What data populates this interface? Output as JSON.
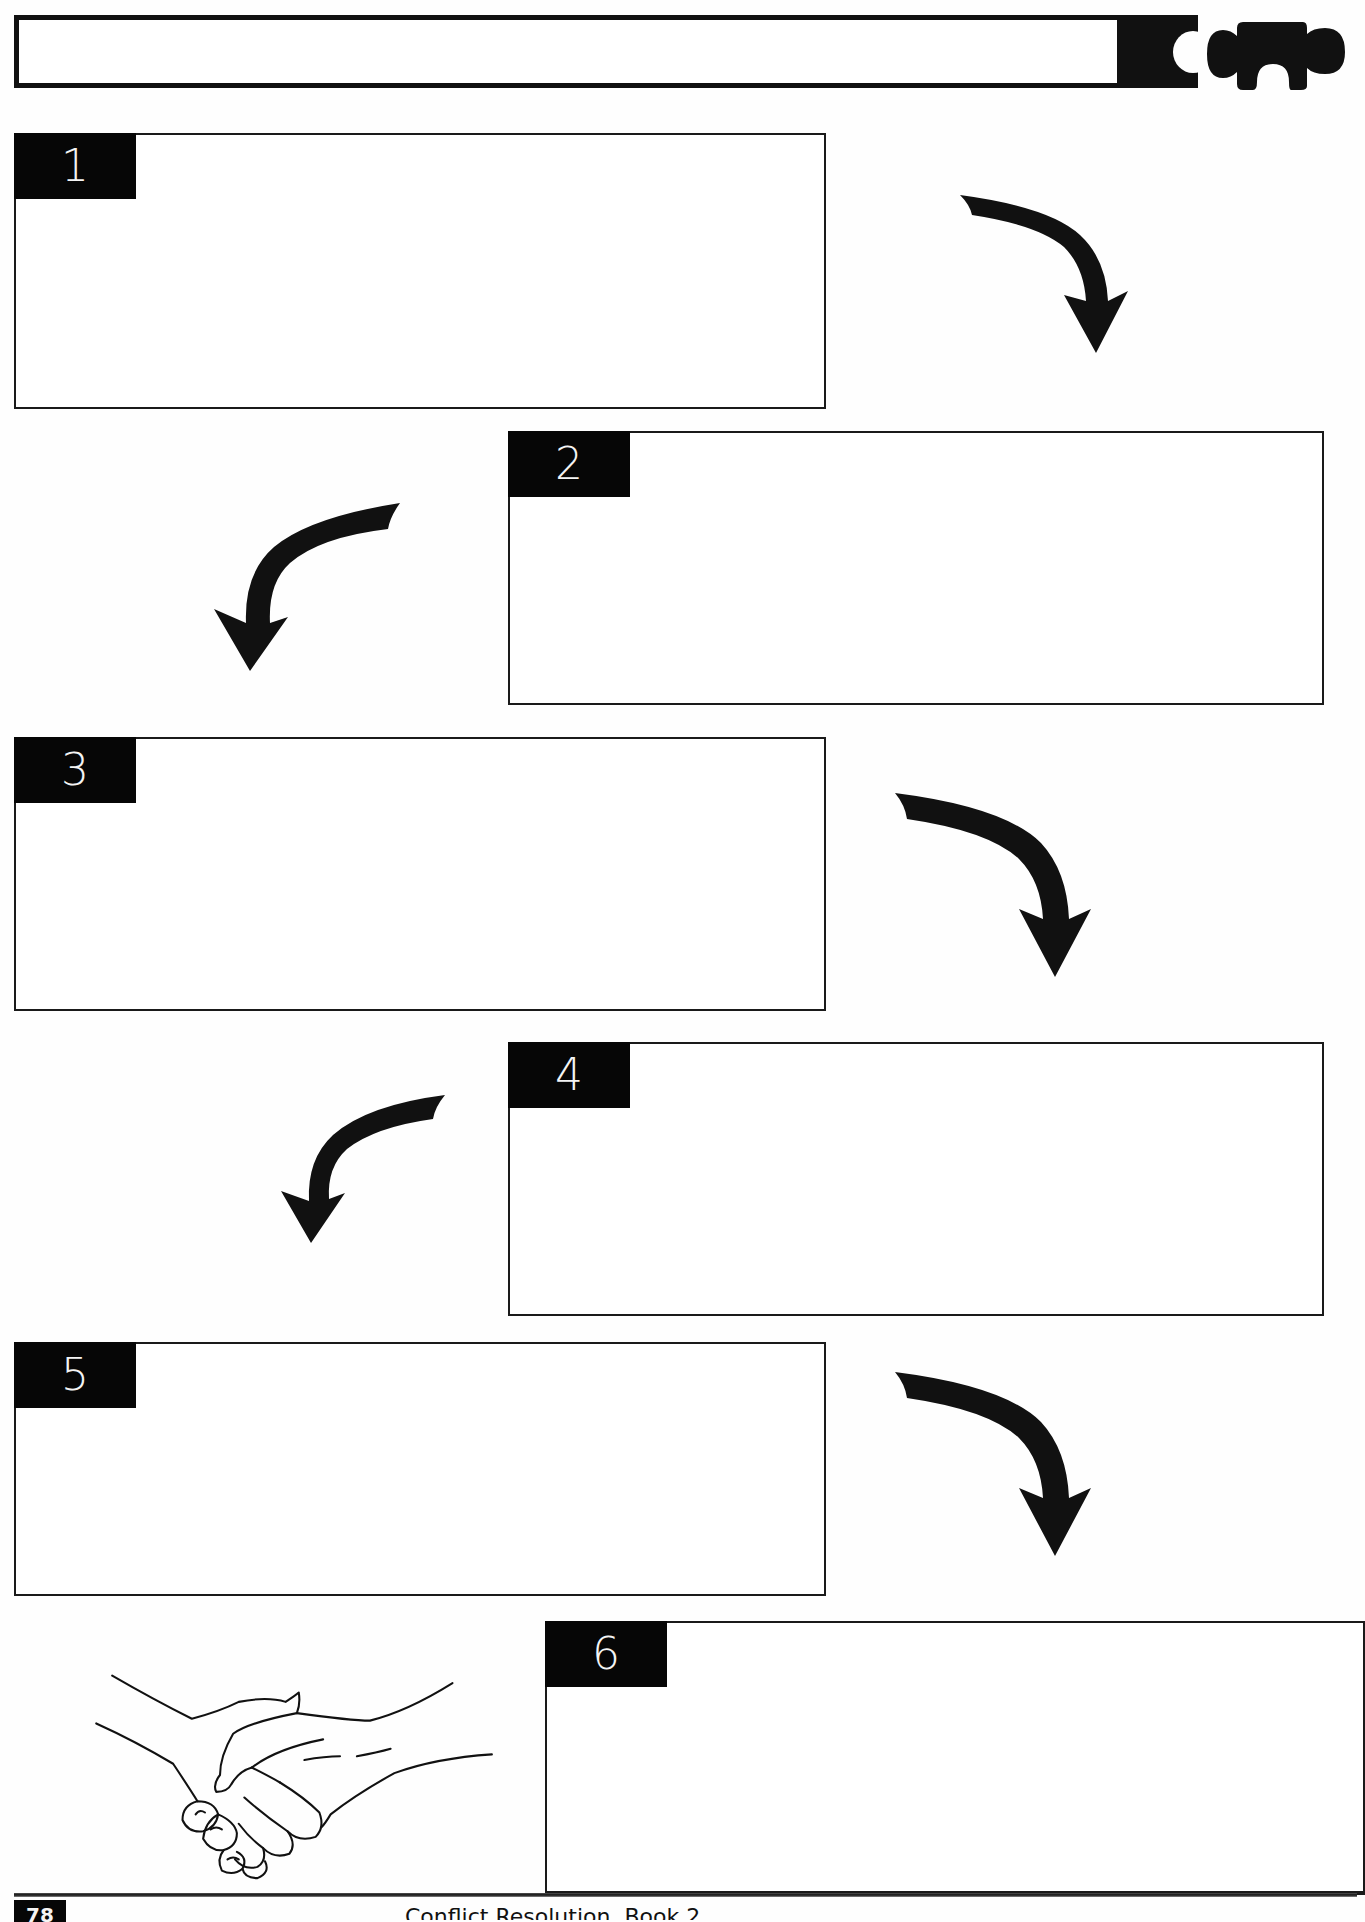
{
  "header": {
    "title_field": "",
    "icon": "puzzle-piece-icon"
  },
  "steps": [
    {
      "number": "1",
      "content": ""
    },
    {
      "number": "2",
      "content": ""
    },
    {
      "number": "3",
      "content": ""
    },
    {
      "number": "4",
      "content": ""
    },
    {
      "number": "5",
      "content": ""
    },
    {
      "number": "6",
      "content": ""
    }
  ],
  "arrows": [
    {
      "from": "1",
      "to": "2",
      "direction": "right-to-down",
      "icon": "curved-arrow-down-right-icon"
    },
    {
      "from": "2",
      "to": "3",
      "direction": "left-to-down",
      "icon": "curved-arrow-down-left-icon"
    },
    {
      "from": "3",
      "to": "4",
      "direction": "right-to-down",
      "icon": "curved-arrow-down-right-icon"
    },
    {
      "from": "4",
      "to": "5",
      "direction": "left-to-down",
      "icon": "curved-arrow-down-left-icon"
    },
    {
      "from": "5",
      "to": "6",
      "direction": "right-to-down",
      "icon": "curved-arrow-down-right-icon"
    }
  ],
  "illustration": {
    "icon": "handshake-icon"
  },
  "footer": {
    "page_number": "78",
    "book_title": "Conflict Resolution, Book 2",
    "right_text": "Lesson ... Handout ..."
  },
  "colors": {
    "ink": "#111111",
    "paper": "#fefefe",
    "tab_text": "#f4f4f4"
  }
}
